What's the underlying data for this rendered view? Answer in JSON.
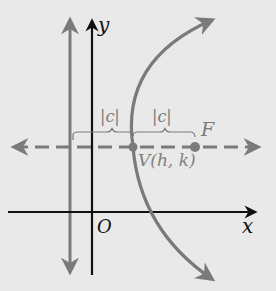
{
  "diagram": {
    "type": "parabola-horizontal-axis",
    "labels": {
      "y_axis": "y",
      "x_axis": "x",
      "origin": "O",
      "focus": "F",
      "vertex": "V(h, k)",
      "distance_left": "|c|",
      "distance_right": "|c|"
    },
    "colors": {
      "background": "#e9e9e9",
      "axes": "#111111",
      "gray": "#7a7a7a",
      "label_gray": "#808080"
    },
    "elements": {
      "axes": "Cartesian axes with origin O",
      "directrix": "vertical gray line with arrows at both ends",
      "axis_of_symmetry": "horizontal dashed gray line with arrows at both ends",
      "parabola": "gray curve opening right with arrowheads",
      "vertex": "point V(h, k)",
      "focus": "point F"
    }
  }
}
